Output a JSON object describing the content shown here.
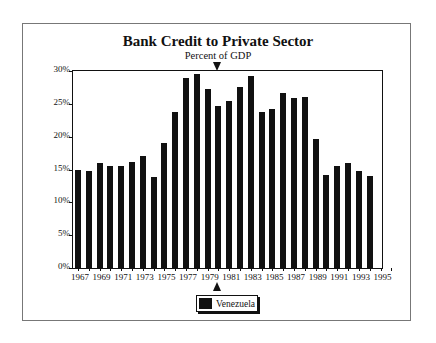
{
  "chart_data": {
    "type": "bar",
    "title": "Bank Credit to Private Sector",
    "subtitle": "Percent of GDP",
    "xlabel": "",
    "ylabel": "",
    "ylim": [
      0,
      30
    ],
    "yticks": [
      "0%",
      "5%",
      "10%",
      "15%",
      "20%",
      "25%",
      "30%"
    ],
    "xticks": [
      "1967",
      "1969",
      "1971",
      "1973",
      "1975",
      "1977",
      "1979",
      "1981",
      "1983",
      "1985",
      "1987",
      "1989",
      "1991",
      "1993",
      "1995"
    ],
    "grid": false,
    "legend_position": "bottom-center",
    "categories": [
      "1967",
      "1968",
      "1969",
      "1970",
      "1971",
      "1972",
      "1973",
      "1974",
      "1975",
      "1976",
      "1977",
      "1978",
      "1979",
      "1980",
      "1981",
      "1982",
      "1983",
      "1984",
      "1985",
      "1986",
      "1987",
      "1988",
      "1989",
      "1990",
      "1991",
      "1992",
      "1993",
      "1994"
    ],
    "series": [
      {
        "name": "Venezuela",
        "color": "#111111",
        "values": [
          15.0,
          14.8,
          16.0,
          15.6,
          15.5,
          16.2,
          17.1,
          13.9,
          19.1,
          23.7,
          28.9,
          29.5,
          27.2,
          24.6,
          25.5,
          27.5,
          29.2,
          23.7,
          24.2,
          26.7,
          25.9,
          26.1,
          19.7,
          14.1,
          15.5,
          16.0,
          14.7,
          14.0
        ]
      }
    ],
    "markers": [
      "triangle marker at 1980 (top and bottom)"
    ]
  },
  "legend": {
    "label": "Venezuela"
  }
}
